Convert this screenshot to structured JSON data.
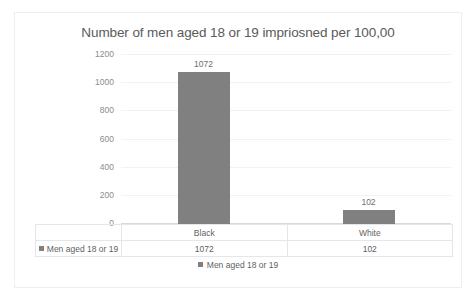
{
  "chart_data": {
    "type": "bar",
    "title": "Number of men aged 18 or 19 impriosned per 100,00",
    "categories": [
      "Black",
      "White"
    ],
    "series": [
      {
        "name": "Men aged 18 or 19",
        "values": [
          1072,
          102
        ],
        "color": "#808080"
      }
    ],
    "xlabel": "",
    "ylabel": "",
    "ylim": [
      0,
      1200
    ],
    "y_ticks": [
      1200,
      1000,
      800,
      600,
      400,
      200,
      0
    ],
    "y_tick_labels": [
      "1200",
      "1000",
      "800",
      "600",
      "400",
      "200",
      "0"
    ],
    "data_labels": [
      "1072",
      "102"
    ],
    "grid": true,
    "legend_position": "bottom",
    "data_table_visible": true
  },
  "legend": {
    "entry_label": "Men aged 18 or 19"
  },
  "data_table": {
    "corner_label": "",
    "column_headers": [
      "Black",
      "White"
    ],
    "rows": [
      {
        "label": "Men aged 18 or 19",
        "values": [
          "1072",
          "102"
        ]
      }
    ]
  },
  "colors": {
    "series": "#808080",
    "gridline": "#f2f2f2",
    "axis": "#d9d9d9",
    "frame_border": "#eceef1",
    "text": "#5f5f5f",
    "title_text": "#5a5a5a",
    "tick_text": "#8c8c8c",
    "background": "#ffffff"
  }
}
